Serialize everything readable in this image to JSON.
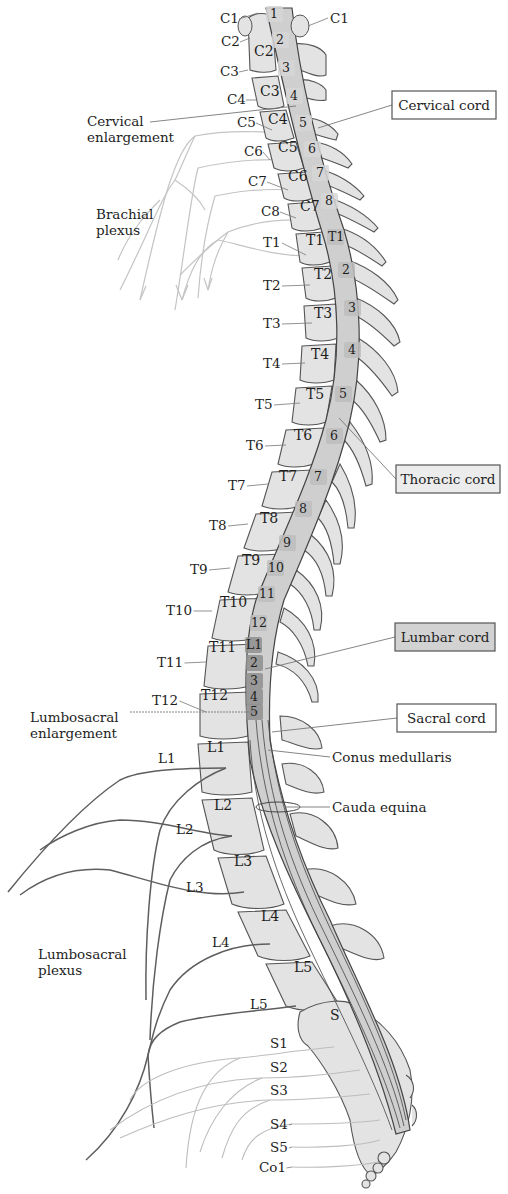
{
  "colors": {
    "bone_fill": "#e3e3e3",
    "bone_stroke": "#555555",
    "cord_fill": "#cfcfcf",
    "cord_stroke": "#444444",
    "cervical_segment": "#d6d6d6",
    "thoracic_segment": "#bdbdbd",
    "lumbar_segment": "#8e8e8e",
    "sacral_segment": "#c8c8c8",
    "cauda": "#9a9a9a",
    "brachial_nerve": "#c4c4c4",
    "lumbar_nerve": "#5e5e5e",
    "sacral_nerve": "#bdbdbd",
    "leader": "#777777",
    "box_white": "#ffffff",
    "box_thoracic": "#ececec",
    "box_lumbar": "#d2d2d2",
    "text": "#1e1e1e"
  },
  "region_boxes": [
    {
      "id": "cervical",
      "label": "Cervical cord",
      "x": 392,
      "y": 91,
      "w": 104,
      "h": 28,
      "fill": "box_white",
      "target": [
        318,
        128
      ]
    },
    {
      "id": "thoracic",
      "label": "Thoracic cord",
      "x": 396,
      "y": 465,
      "w": 104,
      "h": 28,
      "fill": "box_thoracic",
      "target": [
        339,
        418
      ]
    },
    {
      "id": "lumbar",
      "label": "Lumbar cord",
      "x": 395,
      "y": 623,
      "w": 100,
      "h": 28,
      "fill": "box_lumbar",
      "target": [
        265,
        669
      ]
    },
    {
      "id": "sacral",
      "label": "Sacral cord",
      "x": 397,
      "y": 704,
      "w": 99,
      "h": 28,
      "fill": "box_white",
      "target": [
        272,
        732
      ]
    }
  ],
  "annotations": [
    {
      "id": "cervical-enlargement",
      "lines": [
        "Cervical",
        "enlargement"
      ],
      "x": 87,
      "y": 126,
      "leader_from": [
        150,
        122
      ],
      "leader_to": [
        296,
        106
      ]
    },
    {
      "id": "brachial-plexus",
      "lines": [
        "Brachial",
        "plexus"
      ],
      "x": 96,
      "y": 219,
      "leader_from": null,
      "leader_to": null
    },
    {
      "id": "lumbosacral-enlargement",
      "lines": [
        "Lumbosacral",
        "enlargement"
      ],
      "x": 30,
      "y": 722,
      "leader_from": [
        130,
        712
      ],
      "leader_to": [
        258,
        712
      ]
    },
    {
      "id": "conus-medullaris",
      "lines": [
        "Conus medullaris"
      ],
      "x": 332,
      "y": 762,
      "leader_from": [
        330,
        757
      ],
      "leader_to": [
        268,
        750
      ]
    },
    {
      "id": "cauda-equina",
      "lines": [
        "Cauda equina"
      ],
      "x": 332,
      "y": 812,
      "leader_from": [
        330,
        807
      ],
      "leader_to": [
        285,
        807
      ]
    },
    {
      "id": "lumbosacral-plexus",
      "lines": [
        "Lumbosacral",
        "plexus"
      ],
      "x": 38,
      "y": 959,
      "leader_from": null,
      "leader_to": null
    }
  ],
  "nerve_labels": [
    {
      "text": "C1",
      "x": 220,
      "y": 23,
      "lx": 258,
      "ly": 13
    },
    {
      "text": "C2",
      "x": 221,
      "y": 46,
      "lx": 250,
      "ly": 38
    },
    {
      "text": "C3",
      "x": 220,
      "y": 76,
      "lx": 248,
      "ly": 70
    },
    {
      "text": "C4",
      "x": 227,
      "y": 104,
      "lx": 257,
      "ly": 100
    },
    {
      "text": "C5",
      "x": 237,
      "y": 127,
      "lx": 272,
      "ly": 130
    },
    {
      "text": "C6",
      "x": 244,
      "y": 156,
      "lx": 270,
      "ly": 160
    },
    {
      "text": "C7",
      "x": 248,
      "y": 186,
      "lx": 288,
      "ly": 190
    },
    {
      "text": "C8",
      "x": 261,
      "y": 216,
      "lx": 296,
      "ly": 218
    },
    {
      "text": "T1",
      "x": 263,
      "y": 247,
      "lx": 306,
      "ly": 255
    },
    {
      "text": "T2",
      "x": 263,
      "y": 290,
      "lx": 310,
      "ly": 285
    },
    {
      "text": "T3",
      "x": 263,
      "y": 328,
      "lx": 312,
      "ly": 323
    },
    {
      "text": "T4",
      "x": 263,
      "y": 368,
      "lx": 305,
      "ly": 363
    },
    {
      "text": "T5",
      "x": 255,
      "y": 409,
      "lx": 300,
      "ly": 403
    },
    {
      "text": "T6",
      "x": 246,
      "y": 450,
      "lx": 286,
      "ly": 445
    },
    {
      "text": "T7",
      "x": 228,
      "y": 490,
      "lx": 268,
      "ly": 484
    },
    {
      "text": "T8",
      "x": 209,
      "y": 530,
      "lx": 248,
      "ly": 524
    },
    {
      "text": "T9",
      "x": 190,
      "y": 574,
      "lx": 230,
      "ly": 568
    },
    {
      "text": "T10",
      "x": 166,
      "y": 615,
      "lx": 212,
      "ly": 611
    },
    {
      "text": "T11",
      "x": 157,
      "y": 667,
      "lx": 206,
      "ly": 662
    },
    {
      "text": "T12",
      "x": 152,
      "y": 705,
      "lx": 206,
      "ly": 712
    },
    {
      "text": "L1",
      "x": 158,
      "y": 763,
      "lx": 0,
      "ly": 0
    },
    {
      "text": "L2",
      "x": 176,
      "y": 834,
      "lx": 0,
      "ly": 0
    },
    {
      "text": "L3",
      "x": 186,
      "y": 892,
      "lx": 0,
      "ly": 0
    },
    {
      "text": "L4",
      "x": 212,
      "y": 947,
      "lx": 0,
      "ly": 0
    },
    {
      "text": "L5",
      "x": 250,
      "y": 1009,
      "lx": 0,
      "ly": 0
    },
    {
      "text": "S1",
      "x": 270,
      "y": 1048,
      "lx": 0,
      "ly": 0
    },
    {
      "text": "S2",
      "x": 270,
      "y": 1072,
      "lx": 0,
      "ly": 0
    },
    {
      "text": "S3",
      "x": 270,
      "y": 1095,
      "lx": 0,
      "ly": 0
    },
    {
      "text": "S4",
      "x": 270,
      "y": 1129,
      "lx": 292,
      "ly": 1124
    },
    {
      "text": "S5",
      "x": 270,
      "y": 1152,
      "lx": 292,
      "ly": 1147
    },
    {
      "text": "Co1",
      "x": 259,
      "y": 1172,
      "lx": 292,
      "ly": 1167
    }
  ],
  "vertebrae": [
    {
      "text": "C2",
      "x": 254,
      "y": 56
    },
    {
      "text": "C3",
      "x": 260,
      "y": 96
    },
    {
      "text": "C4",
      "x": 268,
      "y": 124
    },
    {
      "text": "C5",
      "x": 278,
      "y": 152
    },
    {
      "text": "C6",
      "x": 288,
      "y": 181
    },
    {
      "text": "C7",
      "x": 300,
      "y": 211
    },
    {
      "text": "T1",
      "x": 306,
      "y": 245
    },
    {
      "text": "T2",
      "x": 314,
      "y": 279
    },
    {
      "text": "T3",
      "x": 314,
      "y": 318
    },
    {
      "text": "T4",
      "x": 311,
      "y": 359
    },
    {
      "text": "T5",
      "x": 306,
      "y": 399
    },
    {
      "text": "T6",
      "x": 294,
      "y": 440
    },
    {
      "text": "T7",
      "x": 279,
      "y": 481
    },
    {
      "text": "T8",
      "x": 260,
      "y": 523
    },
    {
      "text": "T9",
      "x": 242,
      "y": 565
    },
    {
      "text": "T10",
      "x": 220,
      "y": 607
    },
    {
      "text": "T11",
      "x": 209,
      "y": 652
    },
    {
      "text": "T12",
      "x": 201,
      "y": 700
    },
    {
      "text": "L1",
      "x": 207,
      "y": 752
    },
    {
      "text": "L2",
      "x": 214,
      "y": 810
    },
    {
      "text": "L3",
      "x": 234,
      "y": 866
    },
    {
      "text": "L4",
      "x": 261,
      "y": 921
    },
    {
      "text": "L5",
      "x": 294,
      "y": 972
    },
    {
      "text": "S",
      "x": 330,
      "y": 1020
    }
  ],
  "cord_segments": [
    {
      "text": "1",
      "x": 274,
      "y": 18,
      "region": "cervical"
    },
    {
      "text": "2",
      "x": 280,
      "y": 44,
      "region": "cervical"
    },
    {
      "text": "3",
      "x": 286,
      "y": 72,
      "region": "cervical"
    },
    {
      "text": "4",
      "x": 294,
      "y": 100,
      "region": "cervical"
    },
    {
      "text": "5",
      "x": 303,
      "y": 127,
      "region": "cervical"
    },
    {
      "text": "6",
      "x": 312,
      "y": 153,
      "region": "cervical"
    },
    {
      "text": "7",
      "x": 320,
      "y": 177,
      "region": "cervical"
    },
    {
      "text": "8",
      "x": 329,
      "y": 205,
      "region": "cervical"
    },
    {
      "text": "T1",
      "x": 335,
      "y": 241,
      "region": "thoracic"
    },
    {
      "text": "2",
      "x": 346,
      "y": 274,
      "region": "thoracic"
    },
    {
      "text": "3",
      "x": 352,
      "y": 312,
      "region": "thoracic"
    },
    {
      "text": "4",
      "x": 352,
      "y": 354,
      "region": "thoracic"
    },
    {
      "text": "5",
      "x": 343,
      "y": 398,
      "region": "thoracic"
    },
    {
      "text": "6",
      "x": 334,
      "y": 440,
      "region": "thoracic"
    },
    {
      "text": "7",
      "x": 318,
      "y": 481,
      "region": "thoracic"
    },
    {
      "text": "8",
      "x": 303,
      "y": 513,
      "region": "thoracic"
    },
    {
      "text": "9",
      "x": 287,
      "y": 547,
      "region": "thoracic"
    },
    {
      "text": "10",
      "x": 275,
      "y": 572,
      "region": "thoracic"
    },
    {
      "text": "11",
      "x": 266,
      "y": 598,
      "region": "thoracic"
    },
    {
      "text": "12",
      "x": 258,
      "y": 627,
      "region": "thoracic"
    },
    {
      "text": "L1",
      "x": 253,
      "y": 649,
      "region": "lumbar"
    },
    {
      "text": "2",
      "x": 254,
      "y": 667,
      "region": "lumbar"
    },
    {
      "text": "3",
      "x": 254,
      "y": 685,
      "region": "lumbar"
    },
    {
      "text": "4",
      "x": 254,
      "y": 701,
      "region": "lumbar"
    },
    {
      "text": "5",
      "x": 254,
      "y": 716,
      "region": "lumbar"
    }
  ]
}
